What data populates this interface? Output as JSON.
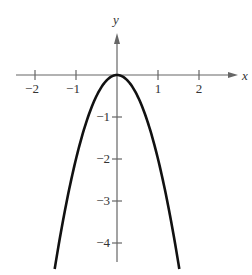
{
  "chart_data": {
    "type": "line",
    "title": "",
    "xlabel": "x",
    "ylabel": "y",
    "function": "y = -2x^2",
    "xlim": [
      -2.5,
      3
    ],
    "ylim": [
      -4.5,
      1.2
    ],
    "x_ticks": [
      -2,
      -1,
      1,
      2
    ],
    "x_tick_labels": [
      "−2",
      "−1",
      "1",
      "2"
    ],
    "y_ticks": [
      -1,
      -2,
      -3,
      -4
    ],
    "y_tick_labels": [
      "−1",
      "−2",
      "−3",
      "−4"
    ],
    "grid": false,
    "legend": null,
    "series": [
      {
        "name": "y = -2x^2",
        "x": [
          -1.5,
          -1.25,
          -1,
          -0.75,
          -0.5,
          -0.25,
          0,
          0.25,
          0.5,
          0.75,
          1,
          1.25,
          1.5
        ],
        "y": [
          -4.5,
          -3.125,
          -2,
          -1.125,
          -0.5,
          -0.125,
          0,
          -0.125,
          -0.5,
          -1.125,
          -2,
          -3.125,
          -4.5
        ]
      }
    ],
    "colors": {
      "curve": "#111111",
      "axes": "#666666",
      "text": "#333333"
    }
  }
}
